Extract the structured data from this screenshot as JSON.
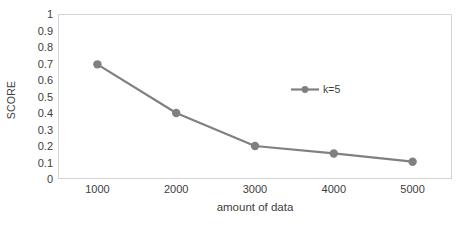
{
  "chart_data": {
    "type": "line",
    "title": "",
    "subtitle": "",
    "xlabel": "amount of data",
    "ylabel": "SCORE",
    "categories": [
      "1000",
      "2000",
      "3000",
      "4000",
      "5000"
    ],
    "x": [
      1000,
      2000,
      3000,
      4000,
      5000
    ],
    "series": [
      {
        "name": "k=5",
        "values": [
          0.695,
          0.4,
          0.2,
          0.155,
          0.105
        ],
        "color": "#808080",
        "marker": "circle"
      }
    ],
    "ylim": [
      0,
      1
    ],
    "ytick_labels": [
      "1",
      "0.9",
      "0.8",
      "0.7",
      "0.6",
      "0.5",
      "0.4",
      "0.3",
      "0.2",
      "0.1",
      "0"
    ],
    "ytick_values": [
      1,
      0.9,
      0.8,
      0.7,
      0.6,
      0.5,
      0.4,
      0.3,
      0.2,
      0.1,
      0
    ],
    "grid": false,
    "legend_position": "inside-right",
    "plot_border_color": "#d4d4d4",
    "background_color": "#ffffff",
    "text_color": "#3d3d3d"
  },
  "legend": {
    "entries": [
      {
        "label": "k=5",
        "color": "#808080"
      }
    ]
  }
}
